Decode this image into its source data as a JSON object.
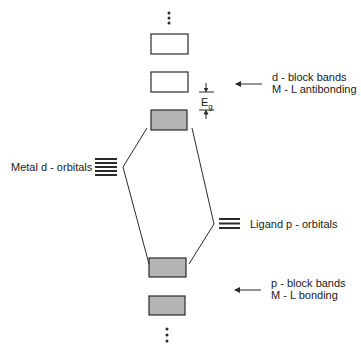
{
  "diagram": {
    "title": "",
    "colors": {
      "stroke": "#2a2a2a",
      "filled_band": "#b4b4b4",
      "empty_band": "#ffffff"
    },
    "bands": [
      {
        "id": "d-band-upper",
        "x": 151,
        "y": 34,
        "w": 37,
        "h": 20,
        "filled": false
      },
      {
        "id": "d-band-lower",
        "x": 151,
        "y": 72,
        "w": 37,
        "h": 20,
        "filled": false
      },
      {
        "id": "p-band-top",
        "x": 151,
        "y": 110,
        "w": 36,
        "h": 20,
        "filled": true
      },
      {
        "id": "p-band-upper",
        "x": 149,
        "y": 258,
        "w": 37,
        "h": 19,
        "filled": true
      },
      {
        "id": "p-band-lower",
        "x": 149,
        "y": 296,
        "w": 36,
        "h": 19,
        "filled": true
      }
    ],
    "ellipsis_top": {
      "x": 169,
      "ys": [
        13,
        18,
        23
      ]
    },
    "ellipsis_bottom": {
      "x": 167,
      "ys": [
        329,
        335,
        341
      ]
    },
    "metal_orbitals": {
      "x1": 95,
      "x2": 117,
      "ys": [
        159,
        163,
        167,
        171,
        175
      ],
      "count": 5
    },
    "ligand_orbitals": {
      "x1": 219,
      "x2": 240,
      "ys": [
        219,
        223.5,
        228
      ],
      "count": 3
    },
    "connector_lines": [
      {
        "points": "147,128 123,167 149,264"
      },
      {
        "points": "192,128 214,224 189,264"
      }
    ],
    "band_gap": {
      "x": 206,
      "top_y": 92,
      "bottom_y": 110,
      "tick_x1": 199,
      "tick_x2": 214,
      "label": "E",
      "subscript": "g"
    },
    "labels": {
      "d_block": {
        "line1": "d - block bands",
        "line2": "M - L antibonding"
      },
      "p_block": {
        "line1": "p - block bands",
        "line2": "M - L bonding"
      },
      "metal": "Metal d - orbitals",
      "ligand": "Ligand p - orbitals"
    },
    "arrows": [
      {
        "id": "d-block-arrow",
        "x1": 262,
        "x2": 236,
        "y": 84
      },
      {
        "id": "p-block-arrow",
        "x1": 261,
        "x2": 235,
        "y": 290
      }
    ]
  }
}
